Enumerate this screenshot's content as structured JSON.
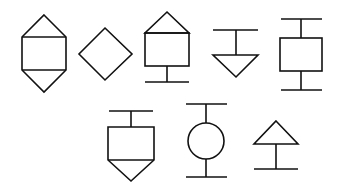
{
  "diagram": {
    "title": "",
    "background": "#ffffff",
    "stroke_color": "#111111",
    "symbol_count": 8,
    "rows": [
      {
        "row": 1,
        "symbols": [
          "hexagon-rect-with-top-and-bottom-triangles",
          "diamond",
          "house-shape-on-stand",
          "inverted-triangle-hanging-from-bar",
          "rectangle-between-two-bars"
        ]
      },
      {
        "row": 2,
        "symbols": [
          "rectangle-with-bottom-point-hanging-from-bar",
          "circle-between-two-bars",
          "triangle-on-stand"
        ]
      }
    ]
  }
}
